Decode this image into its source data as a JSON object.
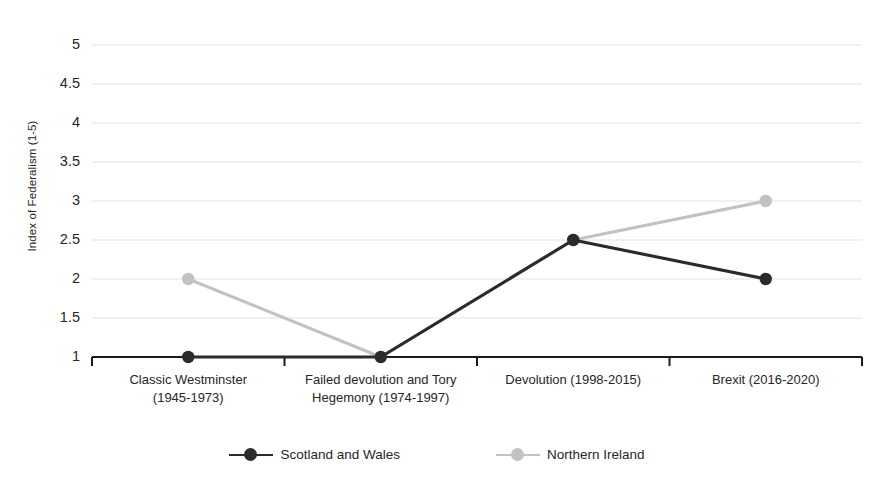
{
  "chart_data": {
    "type": "line",
    "title": "",
    "xlabel": "",
    "ylabel": "Index of Federalism (1-5)",
    "categories": [
      "Classic Westminster (1945-1973)",
      "Failed devolution and Tory Hegemony (1974-1997)",
      "Devolution (1998-2015)",
      "Brexit (2016-2020)"
    ],
    "category_lines": [
      [
        "Classic Westminster",
        "(1945-1973)"
      ],
      [
        "Failed devolution and Tory",
        "Hegemony (1974-1997)"
      ],
      [
        "Devolution (1998-2015)",
        ""
      ],
      [
        "Brexit (2016-2020)",
        ""
      ]
    ],
    "series": [
      {
        "name": "Scotland and Wales",
        "color": "#2b2b2b",
        "values": [
          1,
          1,
          2.5,
          2
        ]
      },
      {
        "name": "Northern Ireland",
        "color": "#c2c2c2",
        "values": [
          2,
          1,
          2.5,
          3
        ]
      }
    ],
    "ylim": [
      1,
      5
    ],
    "yticks": [
      1,
      1.5,
      2,
      2.5,
      3,
      3.5,
      4,
      4.5,
      5
    ],
    "ytick_labels": [
      "1",
      "1.5",
      "2",
      "2.5",
      "3",
      "3.5",
      "4",
      "4.5",
      "5"
    ],
    "grid": true,
    "grid_color": "#e2e2e2",
    "axis_color": "#1a1a1a",
    "legend_position": "bottom",
    "background": "#ffffff"
  },
  "legend": {
    "items": [
      {
        "label": "Scotland and Wales",
        "color": "#2b2b2b"
      },
      {
        "label": "Northern Ireland",
        "color": "#c2c2c2"
      }
    ]
  }
}
